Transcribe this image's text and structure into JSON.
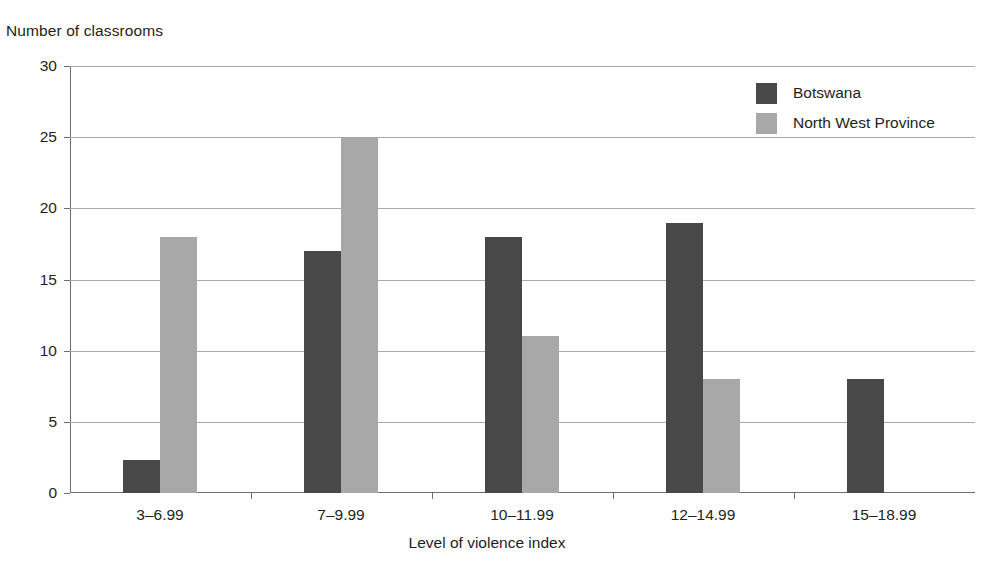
{
  "chart_data": {
    "type": "bar",
    "title": "",
    "xlabel": "Level of violence index",
    "ylabel": "Number of classrooms",
    "categories": [
      "3–6.99",
      "7–9.99",
      "10–11.99",
      "12–14.99",
      "15–18.99"
    ],
    "series": [
      {
        "name": "Botswana",
        "color": "#484848",
        "values": [
          2.3,
          17,
          18,
          19,
          8
        ]
      },
      {
        "name": "North West Province",
        "color": "#a8a8a8",
        "values": [
          18,
          25,
          11,
          8,
          0
        ]
      }
    ],
    "ylim": [
      0,
      30
    ],
    "yticks": [
      0,
      5,
      10,
      15,
      20,
      25,
      30
    ],
    "ytick_labels": [
      "0",
      "5",
      "10",
      "15",
      "20",
      "25",
      "30"
    ],
    "grid": "horizontal",
    "legend_position": "top-right"
  },
  "legend": {
    "entries": [
      {
        "label": "Botswana"
      },
      {
        "label": "North West Province"
      }
    ]
  },
  "axes": {
    "y_title": "Number of classrooms",
    "x_title": "Level of violence index"
  },
  "colors": {
    "series_botswana": "#484848",
    "series_north_west_province": "#a8a8a8",
    "gridline": "#a7a9ac",
    "axis": "#6d6e71",
    "text": "#231f20",
    "background": "#ffffff"
  }
}
